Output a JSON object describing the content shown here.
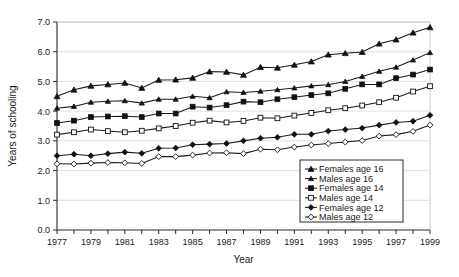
{
  "chart_data": {
    "type": "line",
    "title": "",
    "xlabel": "Year",
    "ylabel": "Years of schooling",
    "xlim": [
      1977,
      1999
    ],
    "ylim": [
      0.0,
      7.0
    ],
    "grid": true,
    "legend_position": "lower-right",
    "x": [
      1977,
      1978,
      1979,
      1980,
      1981,
      1982,
      1983,
      1984,
      1985,
      1986,
      1987,
      1988,
      1989,
      1990,
      1991,
      1992,
      1993,
      1994,
      1995,
      1996,
      1997,
      1998,
      1999
    ],
    "xtick_labels": [
      "1977",
      "1979",
      "1981",
      "1983",
      "1985",
      "1987",
      "1989",
      "1991",
      "1993",
      "1995",
      "1997",
      "1999"
    ],
    "ytick_labels": [
      "0.0",
      "1.0",
      "2.0",
      "3.0",
      "4.0",
      "5.0",
      "6.0",
      "7.0"
    ],
    "series": [
      {
        "name": "Females age 16",
        "marker": "filled-triangle",
        "values": [
          4.5,
          4.72,
          4.85,
          4.9,
          4.95,
          4.78,
          5.05,
          5.06,
          5.12,
          5.33,
          5.32,
          5.22,
          5.48,
          5.46,
          5.56,
          5.67,
          5.9,
          5.95,
          5.99,
          6.27,
          6.41,
          6.64,
          6.82
        ]
      },
      {
        "name": "Males age 16",
        "marker": "filled-triangle-small",
        "values": [
          4.1,
          4.16,
          4.3,
          4.33,
          4.35,
          4.27,
          4.4,
          4.4,
          4.5,
          4.45,
          4.65,
          4.63,
          4.67,
          4.72,
          4.78,
          4.85,
          4.89,
          5.0,
          5.17,
          5.34,
          5.48,
          5.72,
          5.97
        ]
      },
      {
        "name": "Females age 14",
        "marker": "filled-square",
        "values": [
          3.6,
          3.68,
          3.8,
          3.82,
          3.83,
          3.8,
          3.92,
          3.92,
          4.15,
          4.12,
          4.2,
          4.32,
          4.3,
          4.4,
          4.47,
          4.54,
          4.6,
          4.75,
          4.9,
          4.9,
          5.11,
          5.23,
          5.4
        ]
      },
      {
        "name": "Males age 14",
        "marker": "open-square",
        "values": [
          3.21,
          3.29,
          3.38,
          3.33,
          3.29,
          3.34,
          3.42,
          3.5,
          3.61,
          3.68,
          3.62,
          3.67,
          3.78,
          3.76,
          3.85,
          3.94,
          4.03,
          4.1,
          4.19,
          4.3,
          4.45,
          4.66,
          4.84
        ]
      },
      {
        "name": "Females age 12",
        "marker": "filled-diamond",
        "values": [
          2.5,
          2.55,
          2.5,
          2.57,
          2.62,
          2.58,
          2.75,
          2.76,
          2.87,
          2.89,
          2.91,
          3.0,
          3.09,
          3.12,
          3.22,
          3.22,
          3.33,
          3.38,
          3.43,
          3.53,
          3.62,
          3.66,
          3.86
        ]
      },
      {
        "name": "Males age 12",
        "marker": "open-diamond",
        "values": [
          2.23,
          2.22,
          2.25,
          2.27,
          2.26,
          2.24,
          2.47,
          2.47,
          2.52,
          2.59,
          2.6,
          2.57,
          2.72,
          2.7,
          2.79,
          2.86,
          2.91,
          2.96,
          3.01,
          3.16,
          3.21,
          3.32,
          3.53
        ]
      }
    ]
  },
  "colors": {
    "line": "#1a1a1a",
    "grid": "#d9d9d9",
    "axis": "#2b2b2b",
    "background": "#ffffff"
  }
}
